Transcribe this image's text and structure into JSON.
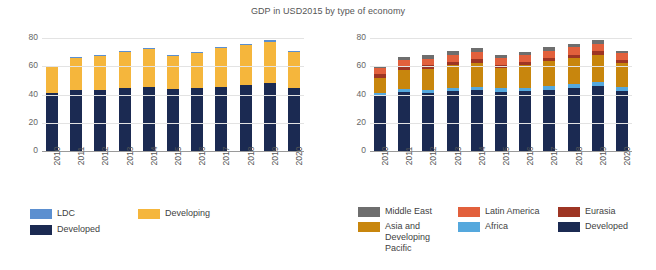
{
  "chart_title": "GDP in USD2015 by type of economy",
  "colors": {
    "developed": "#1b2a52",
    "developing": "#f5b63c",
    "ldc": "#5b8fd0",
    "africa": "#55a8dd",
    "asia_pacific": "#c8860d",
    "eurasia": "#9e3524",
    "latin_america": "#e2603c",
    "middle_east": "#6e6e6e",
    "grid": "#e3e3e3",
    "axis": "#9a9a9a"
  },
  "chart_data": [
    {
      "id": "left",
      "type": "bar",
      "stacked": true,
      "title": "GDP in USD2015 by type of economy",
      "xlabel": "",
      "ylabel": "",
      "ylim": [
        0,
        80
      ],
      "yticks": [
        0,
        20,
        40,
        60,
        80
      ],
      "grid": true,
      "legend_position": "bottom-left",
      "categories": [
        "2010",
        "2011",
        "2012",
        "2013",
        "2014",
        "2015",
        "2016",
        "2017",
        "2018",
        "2019",
        "2020"
      ],
      "series": [
        {
          "name": "Developed",
          "color_key": "developed",
          "values": [
            41.0,
            43.5,
            43.3,
            44.5,
            45.0,
            44.0,
            44.3,
            45.3,
            46.5,
            48.0,
            44.5
          ]
        },
        {
          "name": "Developing",
          "color_key": "developing",
          "values": [
            19.0,
            22.5,
            24.0,
            25.5,
            27.0,
            23.0,
            25.0,
            27.5,
            28.5,
            29.5,
            25.5
          ]
        },
        {
          "name": "LDC",
          "color_key": "ldc",
          "values": [
            0.5,
            0.8,
            0.9,
            0.9,
            1.0,
            0.9,
            0.9,
            1.0,
            1.1,
            1.2,
            1.0
          ]
        }
      ],
      "totals": [
        60.5,
        66.8,
        68.2,
        70.9,
        73.0,
        67.9,
        70.2,
        73.8,
        76.1,
        78.7,
        71.0
      ]
    },
    {
      "id": "right",
      "type": "bar",
      "stacked": true,
      "title": "GDP in USD2015 by type of economy",
      "xlabel": "",
      "ylabel": "",
      "ylim": [
        0,
        80
      ],
      "yticks": [
        0,
        20,
        40,
        60,
        80
      ],
      "grid": true,
      "legend_position": "bottom-right",
      "categories": [
        "2010",
        "2011",
        "2012",
        "2013",
        "2014",
        "2015",
        "2016",
        "2017",
        "2018",
        "2019",
        "2020"
      ],
      "series": [
        {
          "name": "Developed",
          "color_key": "developed",
          "values": [
            39.0,
            41.5,
            41.3,
            42.3,
            43.0,
            42.0,
            42.3,
            43.3,
            44.5,
            46.0,
            42.5
          ]
        },
        {
          "name": "Africa",
          "color_key": "africa",
          "values": [
            2.0,
            2.1,
            2.2,
            2.3,
            2.4,
            2.4,
            2.4,
            2.5,
            2.6,
            2.7,
            2.5
          ]
        },
        {
          "name": "Asia and Developing Pacific",
          "color_key": "asia_pacific",
          "values": [
            11.0,
            13.5,
            14.8,
            16.0,
            17.2,
            14.5,
            16.0,
            17.8,
            18.7,
            19.5,
            17.5
          ]
        },
        {
          "name": "Eurasia",
          "color_key": "eurasia",
          "values": [
            2.2,
            2.4,
            2.4,
            2.4,
            2.4,
            2.2,
            2.2,
            2.3,
            2.4,
            2.4,
            2.2
          ]
        },
        {
          "name": "Latin America",
          "color_key": "latin_america",
          "values": [
            4.3,
            4.7,
            4.8,
            5.0,
            5.2,
            4.8,
            4.8,
            5.0,
            5.2,
            5.3,
            4.8
          ]
        },
        {
          "name": "Middle East",
          "color_key": "middle_east",
          "values": [
            2.0,
            2.6,
            2.7,
            2.9,
            2.8,
            2.0,
            2.5,
            2.9,
            2.7,
            2.8,
            1.5
          ]
        }
      ],
      "totals": [
        60.5,
        66.8,
        68.2,
        70.9,
        73.0,
        67.9,
        70.2,
        73.8,
        76.1,
        78.7,
        71.0
      ]
    }
  ],
  "legend_left": [
    {
      "label": "LDC",
      "color_key": "ldc"
    },
    {
      "label": "Developing",
      "color_key": "developing"
    },
    {
      "label": "Developed",
      "color_key": "developed"
    }
  ],
  "legend_right": [
    {
      "label": "Middle East",
      "color_key": "middle_east"
    },
    {
      "label": "Latin America",
      "color_key": "latin_america"
    },
    {
      "label": "Eurasia",
      "color_key": "eurasia"
    },
    {
      "label": "Asia and Developing Pacific",
      "color_key": "asia_pacific"
    },
    {
      "label": "Africa",
      "color_key": "africa"
    },
    {
      "label": "Developed",
      "color_key": "developed"
    }
  ]
}
